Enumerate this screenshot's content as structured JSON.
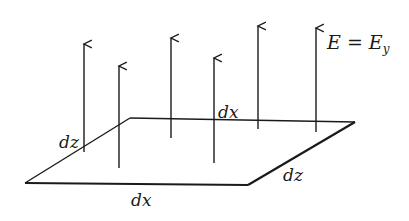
{
  "diagram": {
    "colors": {
      "line": "#1a1a1a",
      "background": "#ffffff"
    },
    "surface": {
      "shape": "parallelogram",
      "vertices": [
        [
          25,
          183
        ],
        [
          248,
          185
        ],
        [
          355,
          122
        ],
        [
          130,
          118
        ]
      ]
    },
    "field_arrows": [
      {
        "x": 84,
        "top": 44,
        "bottom": 152
      },
      {
        "x": 119,
        "top": 66,
        "bottom": 168
      },
      {
        "x": 171,
        "top": 38,
        "bottom": 138
      },
      {
        "x": 214,
        "top": 58,
        "bottom": 163
      },
      {
        "x": 258,
        "top": 26,
        "bottom": 129
      },
      {
        "x": 316,
        "top": 28,
        "bottom": 132
      }
    ],
    "labels": {
      "field_E": "E",
      "field_eq": " = E",
      "field_sub": "y",
      "dx_top": "dx",
      "dz_left": "dz",
      "dz_right": "dz",
      "dx_bottom": "dx"
    }
  }
}
